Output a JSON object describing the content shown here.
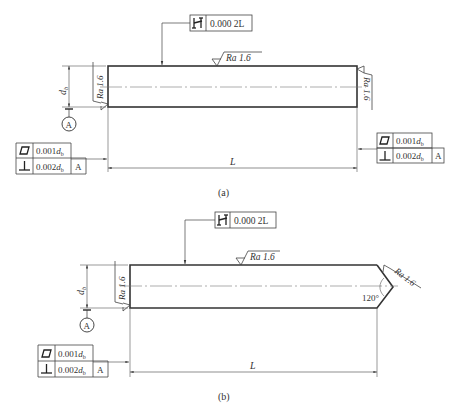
{
  "figure": {
    "colors": {
      "line": "#333333",
      "thin": "#555555",
      "center": "#777777",
      "background": "#ffffff"
    },
    "panel_a": {
      "label": "(a)",
      "straightness_frame": {
        "symbol": "straightness-icon",
        "value": "0.000 2L"
      },
      "roughness_top": {
        "text": "Ra 1.6"
      },
      "roughness_left": {
        "text": "Ra 1.6"
      },
      "roughness_right": {
        "text": "Ra 1.6"
      },
      "diameter_label": {
        "d": "d",
        "sub": "b"
      },
      "datum_label": "A",
      "left_frame": {
        "row1": {
          "symbol": "flatness-icon",
          "value": "0.001",
          "var": "d",
          "sub": "b"
        },
        "row2": {
          "symbol": "perpendicularity-icon",
          "value": "0.002",
          "var": "d",
          "sub": "b",
          "datum": "A"
        }
      },
      "right_frame": {
        "row1": {
          "symbol": "flatness-icon",
          "value": "0.001",
          "var": "d",
          "sub": "b"
        },
        "row2": {
          "symbol": "perpendicularity-icon",
          "value": "0.002",
          "var": "d",
          "sub": "b",
          "datum": "A"
        }
      },
      "length_label": "L"
    },
    "panel_b": {
      "label": "(b)",
      "straightness_frame": {
        "symbol": "straightness-icon",
        "value": "0.000 2L"
      },
      "roughness_top": {
        "text": "Ra 1.6"
      },
      "roughness_left": {
        "text": "Ra 1.6"
      },
      "roughness_tip": {
        "text": "Ra 1.6"
      },
      "tip_angle": "120°",
      "diameter_label": {
        "d": "d",
        "sub": "b"
      },
      "datum_label": "A",
      "left_frame": {
        "row1": {
          "symbol": "flatness-icon",
          "value": "0.001",
          "var": "d",
          "sub": "b"
        },
        "row2": {
          "symbol": "perpendicularity-icon",
          "value": "0.002",
          "var": "d",
          "sub": "b",
          "datum": "A"
        }
      },
      "length_label": "L"
    }
  }
}
